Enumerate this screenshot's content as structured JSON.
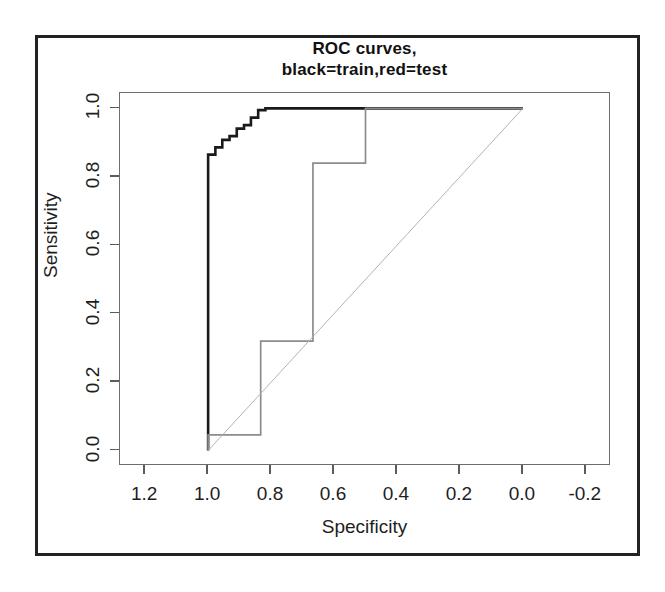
{
  "chart_data": {
    "type": "line",
    "title_line1": "ROC curves,",
    "title_line2": "black=train,red=test",
    "xlabel": "Specificity",
    "ylabel": "Sensitivity",
    "xlim": [
      1.28,
      -0.28
    ],
    "ylim": [
      -0.045,
      1.045
    ],
    "x_reversed": true,
    "grid": false,
    "legend": "none (encoded in title: black=train, red=test)",
    "xticks": [
      1.2,
      1.0,
      0.8,
      0.6,
      0.4,
      0.2,
      0.0,
      -0.2
    ],
    "xticklabels": [
      "1.2",
      "1.0",
      "0.8",
      "0.6",
      "0.4",
      "0.2",
      "0.0",
      "-0.2"
    ],
    "yticks": [
      0.0,
      0.2,
      0.4,
      0.6,
      0.8,
      1.0
    ],
    "yticklabels": [
      "0.0",
      "0.2",
      "0.4",
      "0.6",
      "0.8",
      "1.0"
    ],
    "series": [
      {
        "name": "train",
        "color": "#1a1a1a",
        "style": "step",
        "width": 2.6,
        "points": [
          [
            1.0,
            0.0
          ],
          [
            1.0,
            0.865
          ],
          [
            0.977,
            0.865
          ],
          [
            0.977,
            0.886
          ],
          [
            0.955,
            0.886
          ],
          [
            0.955,
            0.908
          ],
          [
            0.932,
            0.908
          ],
          [
            0.932,
            0.919
          ],
          [
            0.909,
            0.919
          ],
          [
            0.909,
            0.941
          ],
          [
            0.886,
            0.941
          ],
          [
            0.886,
            0.951
          ],
          [
            0.864,
            0.951
          ],
          [
            0.864,
            0.973
          ],
          [
            0.841,
            0.973
          ],
          [
            0.841,
            0.995
          ],
          [
            0.818,
            0.995
          ],
          [
            0.818,
            1.0
          ],
          [
            0.0,
            1.0
          ]
        ]
      },
      {
        "name": "test",
        "color": "#8c8c8c",
        "style": "step",
        "width": 1.7,
        "points": [
          [
            1.0,
            0.0
          ],
          [
            1.0,
            0.046
          ],
          [
            0.833,
            0.046
          ],
          [
            0.833,
            0.32
          ],
          [
            0.667,
            0.32
          ],
          [
            0.667,
            0.84
          ],
          [
            0.5,
            0.84
          ],
          [
            0.5,
            1.0
          ],
          [
            0.0,
            1.0
          ]
        ]
      },
      {
        "name": "chance-diagonal",
        "color": "#b3b3b3",
        "style": "line",
        "width": 1.0,
        "points": [
          [
            1.0,
            0.0
          ],
          [
            0.0,
            1.0
          ]
        ]
      }
    ]
  },
  "figure": {
    "frame_color": "#222222",
    "plot_border_color": "#6d6d6d",
    "background": "#ffffff"
  }
}
